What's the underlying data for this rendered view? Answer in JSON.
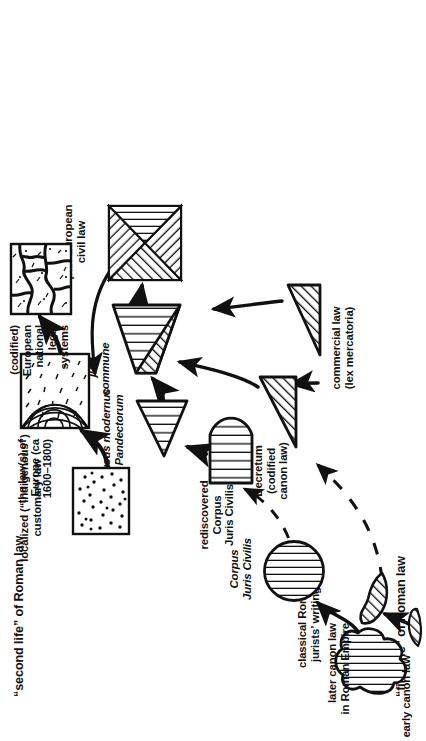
{
  "figure": {
    "orientation": "rotated-90-ccw",
    "ink_color": "#111111",
    "background": "#ffffff",
    "headings": [
      {
        "id": "first-life",
        "text": "“first life” of Roman law"
      },
      {
        "id": "second-life",
        "text": "“second life” of Roman law"
      }
    ],
    "nodes": [
      {
        "id": "classical-roman-jurists-writings",
        "label": "classical Roman\njurists’ writings",
        "italic": false,
        "shape": "blob-vertical-hatch"
      },
      {
        "id": "corpus-juris-civilis",
        "label": "Corpus\nJuris Civilis",
        "italic": true,
        "shape": "circle-vertical-hatch"
      },
      {
        "id": "early-canon-law",
        "label": "early canon law",
        "italic": false,
        "shape": "small-sliver-hatch"
      },
      {
        "id": "later-canon-law-roman-empire",
        "label": "later canon law\nin Roman Empire",
        "italic": false,
        "shape": "wing-diagonal-hatch"
      },
      {
        "id": "rediscovered-corpus-juris-civilis",
        "label": "rediscovered\nCorpus\nJuris Civilis",
        "italic": "partial",
        "shape": "half-disc-vertical-hatch"
      },
      {
        "id": "usus-modernus-pandectorum",
        "label": "usus modernus\nPandectorum",
        "italic": true,
        "shape": "triangle-vertical-hatch"
      },
      {
        "id": "decretum-codified-canon-law",
        "label": "Decretum\n(codified\ncanon law)",
        "italic": "partial",
        "shape": "right-triangle-diagonal-hatch"
      },
      {
        "id": "commercial-law-lex-mercatoria",
        "label": "commercial law\n(lex mercatoria)",
        "italic": "partial",
        "shape": "right-triangle-diagonal-hatch"
      },
      {
        "id": "jus-commune",
        "label": "jus\ncommune",
        "italic": true,
        "shape": "trapezoid-split-hatch"
      },
      {
        "id": "localized-indigenous-customary-law",
        "label": "localized (“indigenous”)\ncustomary law",
        "italic": false,
        "shape": "square-stipple"
      },
      {
        "id": "laws-of-europe",
        "label": "the law(s) of\nEurope (ca\n1600–1800)",
        "italic": false,
        "shape": "square-concentric-arcs"
      },
      {
        "id": "pan-european-civil-law",
        "label": "pan-European\ncivil law",
        "italic": false,
        "shape": "square-diagonal-quadrant-hatch"
      },
      {
        "id": "codified-european-national-legal-systems",
        "label": "(codified)\nEuropean\nnational\nlegal\nsystems",
        "italic": false,
        "shape": "square-mosaic-cracks"
      }
    ],
    "edges": [
      {
        "from": "classical-roman-jurists-writings",
        "to": "corpus-juris-civilis",
        "style": "solid-arrow"
      },
      {
        "from": "early-canon-law",
        "to": "later-canon-law-roman-empire",
        "style": "solid-arrow"
      },
      {
        "from": "corpus-juris-civilis",
        "to": "rediscovered-corpus-juris-civilis",
        "style": "dashed-arrow"
      },
      {
        "from": "later-canon-law-roman-empire",
        "to": "decretum-codified-canon-law",
        "style": "dashed-arrow"
      },
      {
        "from": "rediscovered-corpus-juris-civilis",
        "to": "usus-modernus-pandectorum",
        "style": "solid-arrow"
      },
      {
        "from": "usus-modernus-pandectorum",
        "to": "jus-commune",
        "style": "solid-arrow"
      },
      {
        "from": "decretum-codified-canon-law",
        "to": "jus-commune",
        "style": "solid-arrow"
      },
      {
        "from": "commercial-law-lex-mercatoria",
        "to": "decretum-codified-canon-law",
        "style": "solid-arrow"
      },
      {
        "from": "commercial-law-lex-mercatoria",
        "to": "pan-european-civil-law",
        "style": "solid-arrow"
      },
      {
        "from": "jus-commune",
        "to": "pan-european-civil-law",
        "style": "solid-arrow"
      },
      {
        "from": "localized-indigenous-customary-law",
        "to": "laws-of-europe",
        "style": "solid-arrow"
      },
      {
        "from": "pan-european-civil-law",
        "to": "laws-of-europe",
        "style": "solid-arrow"
      },
      {
        "from": "laws-of-europe",
        "to": "codified-european-national-legal-systems",
        "style": "solid-arrow"
      }
    ]
  }
}
